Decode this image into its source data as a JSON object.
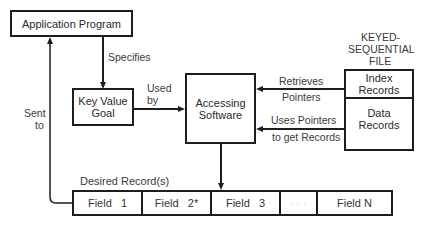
{
  "diagram": {
    "nodes": {
      "application_program": "Application Program",
      "key_value_goal_line1": "Key Value",
      "key_value_goal_line2": "Goal",
      "accessing_software_line1": "Accessing",
      "accessing_software_line2": "Software",
      "file_title_line1": "KEYED-",
      "file_title_line2": "SEQUENTIAL",
      "file_title_line3": "FILE",
      "index_records_line1": "Index",
      "index_records_line2": "Records",
      "data_records_line1": "Data",
      "data_records_line2": "Records"
    },
    "edges": {
      "specifies": "Specifies",
      "used_by_line1": "Used",
      "used_by_line2": "by",
      "retrieves_line1": "Retrieves",
      "retrieves_line2": "Pointers",
      "uses_pointers_line1": "Uses Pointers",
      "uses_pointers_line2": "to get Records",
      "sent_to_line1": "Sent",
      "sent_to_line2": "to"
    },
    "record": {
      "label": "Desired Record(s)",
      "fields": [
        "Field   1",
        "Field   2*",
        "Field   3",
        "· · ·",
        "Field N"
      ]
    }
  }
}
